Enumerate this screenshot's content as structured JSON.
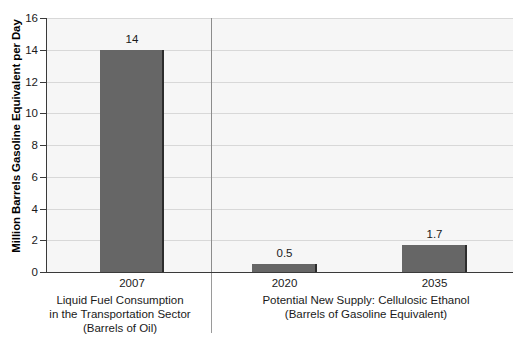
{
  "chart_data": {
    "type": "bar",
    "title": "",
    "subtitle": "",
    "xlabel": "",
    "ylabel": "Million Barrels Gasoline Equivalent per Day",
    "ylim": [
      0,
      16
    ],
    "yticks": [
      0,
      2,
      4,
      6,
      8,
      10,
      12,
      14,
      16
    ],
    "ytick_labels": [
      "0",
      "2",
      "4",
      "6",
      "8",
      "10",
      "12",
      "14",
      "16"
    ],
    "grid": true,
    "legend": false,
    "legend_position": "none",
    "categories": [
      "2007",
      "2020",
      "2035"
    ],
    "values": [
      14,
      0.5,
      1.7
    ],
    "value_labels": [
      "14",
      "0.5",
      "1.7"
    ],
    "bar_color": "#666666",
    "bar_edge_color": "#2d2d2d",
    "plot_background": "#f6f6f6",
    "gridline_color": "#d8d8d8",
    "axis_color": "#3a3a3a",
    "groups": [
      {
        "caption_lines": [
          "Liquid Fuel Consumption",
          "in the Transportation Sector",
          "(Barrels of Oil)"
        ],
        "categories": [
          "2007"
        ]
      },
      {
        "caption_lines": [
          "Potential New Supply: Cellulosic Ethanol",
          "(Barrels of Gasoline Equivalent)"
        ],
        "categories": [
          "2020",
          "2035"
        ]
      }
    ],
    "annotations": [
      {
        "text": "14",
        "category": "2007"
      },
      {
        "text": "0.5",
        "category": "2020"
      },
      {
        "text": "1.7",
        "category": "2035"
      }
    ]
  }
}
